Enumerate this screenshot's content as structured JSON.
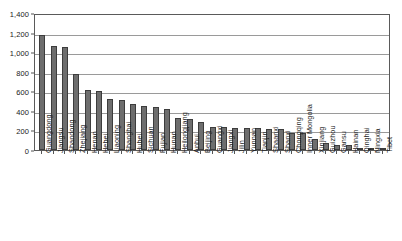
{
  "chart_data": {
    "type": "bar",
    "title": "",
    "subtitle": "",
    "xlabel": "",
    "ylabel": "",
    "ylim": [
      0,
      1400
    ],
    "ytick_step": 200,
    "grid": true,
    "gridlines_horizontal": true,
    "legend": null,
    "legend_position": "none",
    "bar_color": "#6e6e6e",
    "bar_outline_color": "#3d3d3d",
    "axis_color": "#5a5a5a",
    "gridline_color": "#9a9a9a",
    "ytick_labels": [
      "1,400",
      "1,200",
      "1,000",
      "800",
      "600",
      "400",
      "200",
      "0"
    ],
    "ytick_values": [
      1400,
      1200,
      1000,
      800,
      600,
      400,
      200,
      0
    ],
    "categories": [
      "Guangdong",
      "Jiangsu",
      "Shandong",
      "Zhejiang",
      "Henan",
      "Hebei",
      "Liaoning",
      "Shanghai",
      "Hubei",
      "Sichuan",
      "Fujian",
      "Hunan",
      "Heilongjiang",
      "Anhui",
      "Beijing",
      "Guangxi",
      "Jiangxi",
      "Jilin",
      "Yunnan",
      "Tianjin",
      "Shaanxi",
      "Shanxi",
      "Chongqing",
      "Inner Mongolia",
      "Xinjiang",
      "Guizhou",
      "Gansu",
      "Hainan",
      "Qinghai",
      "Ningxia",
      "Tibet"
    ],
    "values": [
      1175,
      1065,
      1050,
      780,
      610,
      605,
      520,
      510,
      470,
      450,
      440,
      420,
      330,
      320,
      290,
      240,
      235,
      230,
      225,
      220,
      215,
      210,
      175,
      170,
      110,
      75,
      55,
      50,
      25,
      20,
      15
    ]
  }
}
